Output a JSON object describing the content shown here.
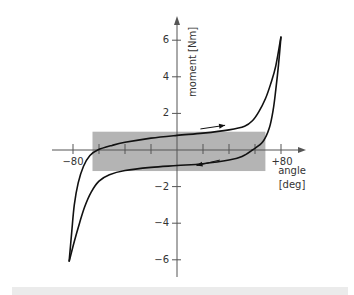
{
  "chart_data": {
    "type": "line",
    "title": "",
    "xlabel": "angle [deg]",
    "ylabel": "moment [Nm]",
    "xlabel_lines": [
      "angle",
      "[deg]"
    ],
    "xlim": [
      -100,
      100
    ],
    "ylim": [
      -7,
      7.2
    ],
    "x_ticks": [
      -80,
      -60,
      -40,
      -20,
      0,
      20,
      40,
      60,
      80
    ],
    "x_tick_labels": [
      {
        "value": -80,
        "label": "−80"
      },
      {
        "value": 80,
        "label": "+80"
      }
    ],
    "y_ticks": [
      6,
      4,
      2,
      -2,
      -4,
      -6
    ],
    "y_tick_labels": [
      {
        "value": 6,
        "label": "6"
      },
      {
        "value": 4,
        "label": "4"
      },
      {
        "value": 2,
        "label": "2"
      },
      {
        "value": -2,
        "label": "−2"
      },
      {
        "value": -4,
        "label": "−4"
      },
      {
        "value": -6,
        "label": "−6"
      }
    ],
    "grid": false,
    "legend": null,
    "shaded_region": {
      "x": [
        -65,
        68
      ],
      "y": [
        -1.15,
        1.0
      ],
      "color": "#b4b4b4"
    },
    "series": [
      {
        "name": "loading (increasing angle)",
        "points": [
          [
            -83,
            -6.1
          ],
          [
            -81,
            -4.5
          ],
          [
            -79,
            -3.0
          ],
          [
            -76,
            -1.8
          ],
          [
            -72,
            -0.9
          ],
          [
            -67,
            -0.3
          ],
          [
            -61,
            0.0
          ],
          [
            -50,
            0.25
          ],
          [
            -40,
            0.42
          ],
          [
            -20,
            0.65
          ],
          [
            0,
            0.8
          ],
          [
            20,
            0.92
          ],
          [
            40,
            1.1
          ],
          [
            52,
            1.3
          ],
          [
            58,
            1.6
          ],
          [
            63,
            2.1
          ],
          [
            68,
            2.8
          ],
          [
            72,
            3.6
          ],
          [
            76,
            4.6
          ],
          [
            80,
            6.2
          ]
        ]
      },
      {
        "name": "unloading (decreasing angle)",
        "points": [
          [
            80,
            6.2
          ],
          [
            78,
            4.6
          ],
          [
            76,
            3.3
          ],
          [
            74,
            2.2
          ],
          [
            71,
            1.2
          ],
          [
            66,
            0.45
          ],
          [
            58,
            0.0
          ],
          [
            50,
            -0.35
          ],
          [
            40,
            -0.55
          ],
          [
            20,
            -0.75
          ],
          [
            0,
            -0.85
          ],
          [
            -20,
            -0.95
          ],
          [
            -40,
            -1.12
          ],
          [
            -52,
            -1.35
          ],
          [
            -60,
            -1.7
          ],
          [
            -66,
            -2.3
          ],
          [
            -71,
            -3.1
          ],
          [
            -75,
            -4.0
          ],
          [
            -79,
            -5.0
          ],
          [
            -83,
            -6.1
          ]
        ]
      }
    ],
    "annotations": [
      {
        "type": "arrow",
        "from": [
          18,
          1.15
        ],
        "to": [
          37,
          1.35
        ],
        "meaning": "loading direction"
      },
      {
        "type": "arrow",
        "from": [
          33,
          -0.55
        ],
        "to": [
          15,
          -0.85
        ],
        "meaning": "unloading direction"
      }
    ]
  },
  "labels": {
    "ylabel": "moment [Nm]",
    "xlabel_line1": "angle",
    "xlabel_line2": "[deg]"
  },
  "colors": {
    "curve": "#111111",
    "axis": "#555555",
    "shade": "#b4b4b4",
    "text": "#333333",
    "band": "#ebebeb"
  }
}
